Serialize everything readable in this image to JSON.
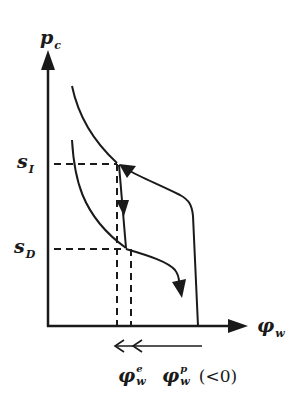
{
  "diagram": {
    "colors": {
      "stroke": "#1a1a1a",
      "background": "#ffffff"
    },
    "y_axis": {
      "symbol": "p",
      "subscript": "c"
    },
    "x_axis": {
      "symbol": "φ",
      "subscript": "w"
    },
    "levels": [
      {
        "symbol": "s",
        "subscript": "I"
      },
      {
        "symbol": "s",
        "subscript": "D"
      }
    ],
    "bottom_labels": {
      "elastic": {
        "symbol": "φ",
        "superscript": "e",
        "subscript": "w"
      },
      "plastic": {
        "symbol": "φ",
        "superscript": "p",
        "subscript": "w",
        "note": "(<0)"
      }
    },
    "arrows_under_axis": {
      "direction": "left",
      "count": 2
    }
  }
}
